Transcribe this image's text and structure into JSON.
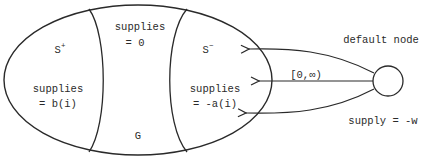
{
  "diagram": {
    "type": "network-flow-regions",
    "colors": {
      "stroke": "#2a2a2a",
      "text": "#2a2a2a",
      "background": "#ffffff"
    },
    "graph": {
      "name": "G",
      "label": "G"
    },
    "regions": [
      {
        "id": "s-plus",
        "set_base": "S",
        "set_sup": "+",
        "supplies_line1": "supplies",
        "supplies_line2": "= b(i)"
      },
      {
        "id": "middle",
        "supplies_line1": "supplies",
        "supplies_line2": "= 0"
      },
      {
        "id": "s-minus",
        "set_base": "S",
        "set_sup": "−",
        "supplies_line1": "supplies",
        "supplies_line2": "= -a(i)"
      }
    ],
    "default_node": {
      "label": "default node",
      "supply": "supply = -w"
    },
    "edges": {
      "count": 3,
      "direction": "default node → S−",
      "capacity_label": "[0,∞)"
    }
  }
}
